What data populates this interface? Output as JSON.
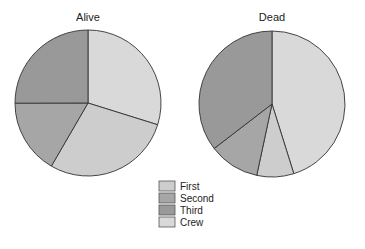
{
  "chart_data": [
    {
      "type": "pie",
      "title": "Alive",
      "categories": [
        "Crew",
        "First",
        "Second",
        "Third"
      ],
      "values": [
        212,
        203,
        118,
        178
      ],
      "percent": [
        29.8,
        28.6,
        16.6,
        25.0
      ],
      "start_angle": "12 o'clock",
      "direction": "clockwise"
    },
    {
      "type": "pie",
      "title": "Dead",
      "categories": [
        "Crew",
        "First",
        "Second",
        "Third"
      ],
      "values": [
        673,
        122,
        167,
        528
      ],
      "percent": [
        45.2,
        8.2,
        11.2,
        35.4
      ],
      "start_angle": "12 o'clock",
      "direction": "clockwise"
    }
  ],
  "legend": {
    "position": "bottom-center",
    "items": [
      {
        "label": "First",
        "color": "#cdcdcd"
      },
      {
        "label": "Second",
        "color": "#a6a6a6"
      },
      {
        "label": "Third",
        "color": "#999999"
      },
      {
        "label": "Crew",
        "color": "#d9d9d9"
      }
    ]
  },
  "colors": {
    "Crew": "#d9d9d9",
    "First": "#cdcdcd",
    "Second": "#a6a6a6",
    "Third": "#999999",
    "outline": "#333333"
  }
}
